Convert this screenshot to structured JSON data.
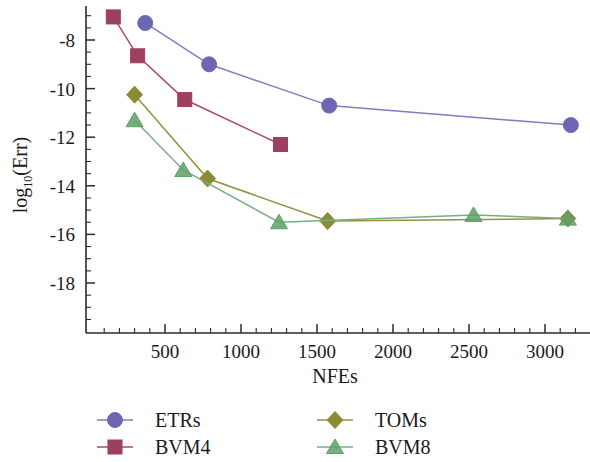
{
  "chart_data": {
    "type": "line",
    "title": "",
    "xlabel": "NFEs",
    "ylabel": "log10(Err)",
    "ylabel_base": "log",
    "ylabel_sub": "10",
    "ylabel_arg": "(Err)",
    "xlim": [
      0,
      3300
    ],
    "ylim": [
      -19.6,
      -6.6
    ],
    "xticks": [
      500,
      1000,
      1500,
      2000,
      2500,
      3000
    ],
    "xtick_labels": [
      "500",
      "1000",
      "1500",
      "2000",
      "2500",
      "3000"
    ],
    "yticks": [
      -8,
      -10,
      -12,
      -14,
      -16,
      -18
    ],
    "ytick_labels": [
      "-8",
      "-10",
      "-12",
      "-14",
      "-16",
      "-18"
    ],
    "x_minor_step": 100,
    "y_minor_step": 0.5,
    "grid": false,
    "legend_position": "below",
    "series": [
      {
        "name": "ETRs",
        "marker": "circle",
        "color": "#6b67b4",
        "line_color": "#7f7cc0",
        "x": [
          370,
          790,
          1580,
          3170
        ],
        "y": [
          -7.3,
          -9.0,
          -10.7,
          -11.5
        ]
      },
      {
        "name": "BVM4",
        "marker": "square",
        "color": "#9d3f61",
        "line_color": "#a8486a",
        "x": [
          160,
          320,
          630,
          1260
        ],
        "y": [
          -7.05,
          -8.65,
          -10.45,
          -12.3
        ]
      },
      {
        "name": "TOMs",
        "marker": "diamond",
        "color": "#8d8a36",
        "line_color": "#94913f",
        "x": [
          300,
          780,
          1570,
          3150
        ],
        "y": [
          -10.25,
          -13.7,
          -15.45,
          -15.35
        ]
      },
      {
        "name": "BVM8",
        "marker": "triangle",
        "color": "#5fa06a",
        "line_color": "#79ae84",
        "x": [
          300,
          620,
          1250,
          2530,
          3150
        ],
        "y": [
          -11.3,
          -13.35,
          -15.5,
          -15.2,
          -15.35
        ]
      }
    ]
  },
  "legend": {
    "entries": [
      {
        "label": "ETRs"
      },
      {
        "label": "BVM4"
      },
      {
        "label": "TOMs"
      },
      {
        "label": "BVM8"
      }
    ]
  }
}
